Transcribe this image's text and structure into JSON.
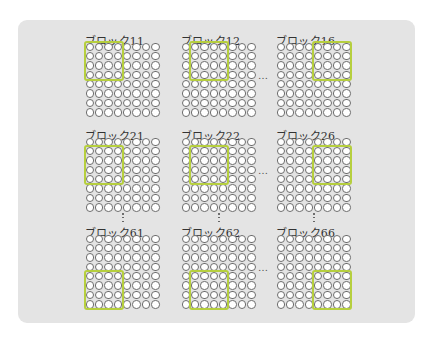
{
  "diagram": {
    "type": "block-grid-illustration",
    "grid_size": {
      "rows": 8,
      "cols": 8
    },
    "highlight_size": {
      "rows": 4,
      "cols": 4
    },
    "highlight_color": "#b6cf3e",
    "panel_color": "#e4e4e4",
    "column_ellipsis": "…",
    "row_ellipsis": "⋮",
    "blocks": [
      {
        "label": "ブロック11",
        "row": 0,
        "col": 0,
        "highlight": {
          "row": 0,
          "col": 0
        }
      },
      {
        "label": "ブロック12",
        "row": 0,
        "col": 1,
        "highlight": {
          "row": 0,
          "col": 1
        }
      },
      {
        "label": "ブロック16",
        "row": 0,
        "col": 2,
        "highlight": {
          "row": 0,
          "col": 4
        }
      },
      {
        "label": "ブロック21",
        "row": 1,
        "col": 0,
        "highlight": {
          "row": 1,
          "col": 0
        }
      },
      {
        "label": "ブロック22",
        "row": 1,
        "col": 1,
        "highlight": {
          "row": 1,
          "col": 1
        }
      },
      {
        "label": "ブロック26",
        "row": 1,
        "col": 2,
        "highlight": {
          "row": 1,
          "col": 4
        }
      },
      {
        "label": "ブロック61",
        "row": 2,
        "col": 0,
        "highlight": {
          "row": 4,
          "col": 0
        }
      },
      {
        "label": "ブロック62",
        "row": 2,
        "col": 1,
        "highlight": {
          "row": 4,
          "col": 1
        }
      },
      {
        "label": "ブロック66",
        "row": 2,
        "col": 2,
        "highlight": {
          "row": 4,
          "col": 4
        }
      }
    ]
  }
}
